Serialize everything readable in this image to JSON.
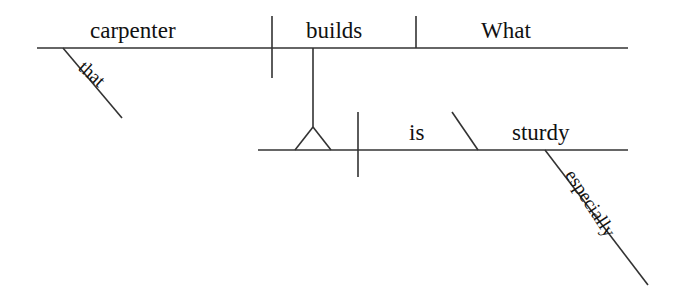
{
  "diagram": {
    "type": "reed-kellogg-sentence-diagram",
    "sentence": "What that carpenter builds is especially sturdy.",
    "ink_color": "#333333",
    "text_color": "#111111",
    "background_color": "#ffffff",
    "clauses": {
      "noun_clause": {
        "role": "subject-clause",
        "subject": "carpenter",
        "verb": "builds",
        "direct_object": "What",
        "modifier": "that"
      },
      "main_clause": {
        "role": "independent-clause",
        "linking_verb": "is",
        "predicate_adjective": "sturdy",
        "adverb": "especially"
      }
    },
    "words": {
      "carpenter": "carpenter",
      "builds": "builds",
      "what": "What",
      "that": "that",
      "is": "is",
      "sturdy": "sturdy",
      "especially": "especially"
    }
  }
}
